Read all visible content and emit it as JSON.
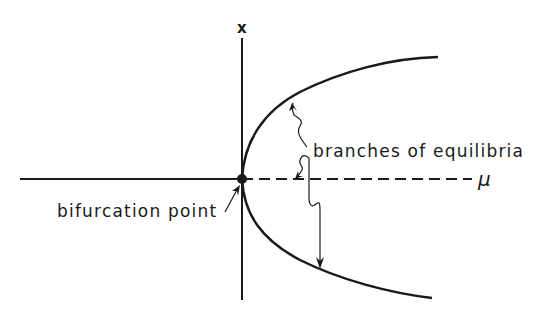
{
  "diagram": {
    "type": "pitchfork-bifurcation",
    "axes": {
      "vertical_label": "x",
      "horizontal_label": "μ"
    },
    "annotations": {
      "branches": "branches of equilibria",
      "bifurcation": "bifurcation point"
    },
    "colors": {
      "ink": "#1a1a1a",
      "background": "#ffffff"
    }
  }
}
